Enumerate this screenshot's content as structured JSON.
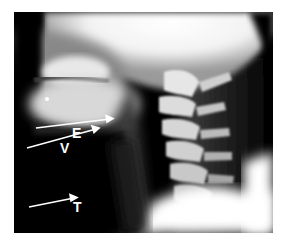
{
  "image": {
    "description": "Lateral soft-tissue neck radiograph",
    "background": "#ffffff",
    "film_color": "#000000"
  },
  "annotations": [
    {
      "id": "E",
      "label": "E",
      "x": 83,
      "y": 126
    },
    {
      "id": "V",
      "label": "V",
      "x": 74,
      "y": 142
    },
    {
      "id": "T",
      "label": "T",
      "x": 82,
      "y": 203
    }
  ]
}
